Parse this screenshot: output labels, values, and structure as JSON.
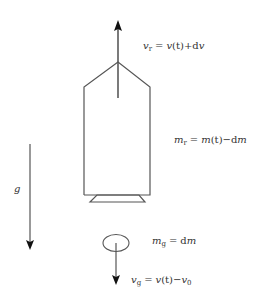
{
  "diagram": {
    "type": "physics-free-body",
    "colors": {
      "stroke": "#555555",
      "arrow": "#222222",
      "text": "#333333",
      "background": "#ffffff"
    },
    "labels": {
      "rocket_velocity": {
        "symbol": "v",
        "subscript": "r",
        "rhs_1": "v",
        "rhs_2": "(t)+d",
        "rhs_3": "v"
      },
      "rocket_mass": {
        "symbol": "m",
        "subscript": "r",
        "rhs_1": "m",
        "rhs_2": "(t)−d",
        "rhs_3": "m"
      },
      "gravity": {
        "symbol": "g"
      },
      "gas_mass": {
        "symbol": "m",
        "subscript": "g",
        "rhs_1": "d",
        "rhs_2": "m"
      },
      "gas_velocity": {
        "symbol": "v",
        "subscript": "g",
        "rhs_1": "v",
        "rhs_2": "(t)−",
        "rhs_3": "v",
        "rhs_3_sub": "0"
      },
      "equals": "="
    },
    "elements": [
      {
        "id": "rocket-velocity-arrow",
        "direction": "up"
      },
      {
        "id": "rocket-body",
        "shape": "pentagon-with-nozzle"
      },
      {
        "id": "gravity-arrow",
        "direction": "down"
      },
      {
        "id": "ejected-gas-mass",
        "shape": "ellipse"
      },
      {
        "id": "gas-velocity-arrow",
        "direction": "down"
      }
    ]
  }
}
